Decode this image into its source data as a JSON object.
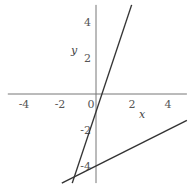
{
  "chart_data": {
    "type": "line",
    "title": "",
    "xlabel": "x",
    "ylabel": "y",
    "xlim": [
      -4.9,
      5.05
    ],
    "ylim": [
      -4.95,
      4.95
    ],
    "grid": false,
    "legend": null,
    "x_ticks": [
      -4,
      -2,
      0,
      2,
      4
    ],
    "x_tick_labels": [
      "-4",
      "-2",
      "0",
      "2",
      "4"
    ],
    "y_ticks": [
      -4,
      -2,
      2,
      4
    ],
    "y_tick_labels": [
      "-4",
      "-2",
      "2",
      "4"
    ],
    "series": [
      {
        "name": "y = 3x - 1",
        "slope": 3,
        "intercept": -1,
        "x": [
          -1.32,
          1.98
        ],
        "y": [
          -4.95,
          4.95
        ],
        "color": "#333333"
      },
      {
        "name": "y = 0.5x - 4",
        "slope": 0.5,
        "intercept": -4,
        "x": [
          -1.9,
          5.05
        ],
        "y": [
          -4.95,
          -1.47
        ],
        "color": "#333333"
      }
    ],
    "axis_color": "#777777"
  }
}
